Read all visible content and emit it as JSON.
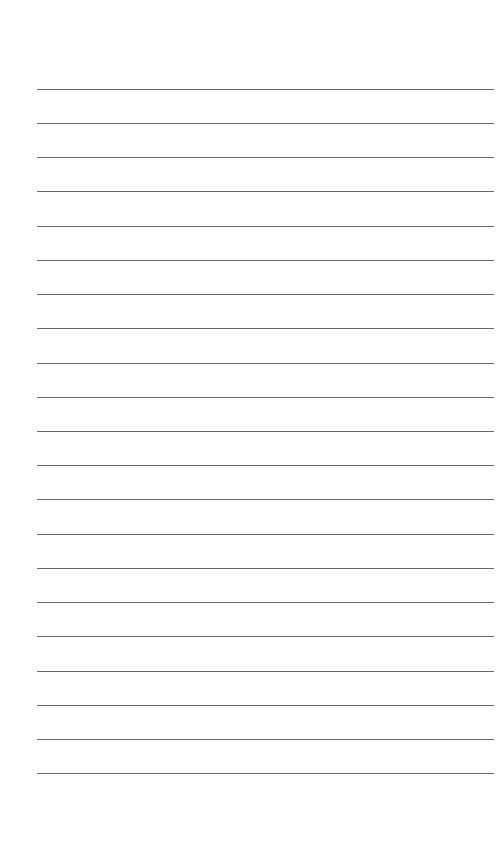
{
  "page": {
    "type": "lined-paper",
    "background_color": "#ffffff",
    "line_color": "#6b6b6b",
    "line_count": 21,
    "line_left_px": 37,
    "line_right_px": 494,
    "first_line_y_px": 88.7,
    "line_spacing_px": 34.23
  },
  "lines": [
    {
      "index": 1,
      "text": ""
    },
    {
      "index": 2,
      "text": ""
    },
    {
      "index": 3,
      "text": ""
    },
    {
      "index": 4,
      "text": ""
    },
    {
      "index": 5,
      "text": ""
    },
    {
      "index": 6,
      "text": ""
    },
    {
      "index": 7,
      "text": ""
    },
    {
      "index": 8,
      "text": ""
    },
    {
      "index": 9,
      "text": ""
    },
    {
      "index": 10,
      "text": ""
    },
    {
      "index": 11,
      "text": ""
    },
    {
      "index": 12,
      "text": ""
    },
    {
      "index": 13,
      "text": ""
    },
    {
      "index": 14,
      "text": ""
    },
    {
      "index": 15,
      "text": ""
    },
    {
      "index": 16,
      "text": ""
    },
    {
      "index": 17,
      "text": ""
    },
    {
      "index": 18,
      "text": ""
    },
    {
      "index": 19,
      "text": ""
    },
    {
      "index": 20,
      "text": ""
    },
    {
      "index": 21,
      "text": ""
    }
  ]
}
